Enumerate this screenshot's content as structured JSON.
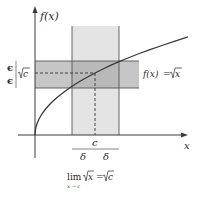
{
  "diagram": {
    "y_axis_label": "f(x)",
    "x_axis_label": "x",
    "function_label": "f(x) = √x",
    "function_label_parts": {
      "lhs": "f(x)",
      "eq": "=",
      "rhs": "x"
    },
    "epsilon_top": "ϵ",
    "epsilon_bottom": "ϵ",
    "sqrt_c_label": "c",
    "c_label": "c",
    "delta_left": "δ",
    "delta_right": "δ",
    "limit_caption": {
      "lim": "lim",
      "sub": "x → c",
      "expr_x": "x",
      "eq": "=",
      "expr_c": "c"
    },
    "colors": {
      "axis": "#3a3a3a",
      "curve": "#3a3a3a",
      "vertical_band": "#e3e3e3",
      "horizontal_band": "#c4c4c4",
      "overlap": "#b8b8b8",
      "band_border": "#555555"
    }
  }
}
